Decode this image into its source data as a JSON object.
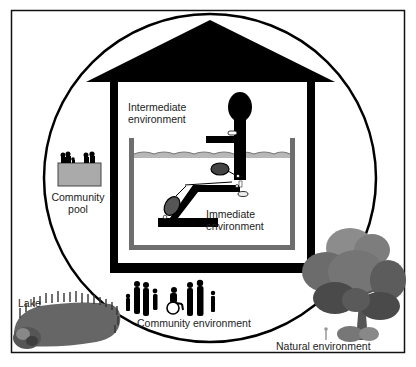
{
  "diagram": {
    "type": "nested-environments-illustration",
    "labels": {
      "intermediate": [
        "Intermediate",
        "environment"
      ],
      "immediate": [
        "Immediate",
        "environment"
      ],
      "community_pool": [
        "Community",
        "pool"
      ],
      "community": "Community environment",
      "lake": "Lake",
      "natural": "Natural environment"
    },
    "colors": {
      "ink": "#000000",
      "frame": "#111111",
      "pool_wall": "#6e6e6e",
      "water_line": "#8a8a8a",
      "water_fill": "#b8b8b8",
      "lake": "#6a6a6a",
      "tree_light": "#8c8c8c",
      "tree_mid": "#6c6c6c",
      "tree_dark": "#4a4a4a",
      "trunk": "#555555",
      "text": "#222222"
    },
    "icons": [
      "house-roof-icon",
      "person-in-pool-chair-icon",
      "community-pool-icon",
      "family-group-icon",
      "wheelchair-user-icon",
      "tree-icon",
      "lake-icon",
      "bush-icon",
      "flower-icon"
    ]
  }
}
